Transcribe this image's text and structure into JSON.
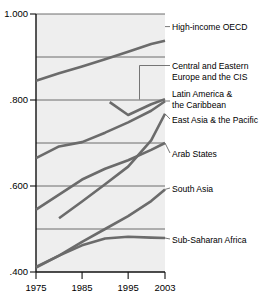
{
  "chart_data": {
    "type": "line",
    "title": "",
    "subtitle": "",
    "xlabel": "",
    "ylabel": "",
    "x": [
      1975,
      1980,
      1985,
      1990,
      1995,
      2000,
      2003
    ],
    "xlim": [
      1975,
      2003
    ],
    "ylim": [
      0.4,
      1.0
    ],
    "grid": true,
    "gridlines_y": [
      0.5,
      0.6,
      0.7,
      0.8,
      0.9,
      1.0
    ],
    "legend_position": "right-inline-labels",
    "x_ticks": [
      "1975",
      "1985",
      "1995",
      "2003"
    ],
    "x_tick_values": [
      1975,
      1985,
      1995,
      2003
    ],
    "y_ticks": [
      "1.000",
      ".800",
      ".600",
      ".400"
    ],
    "y_tick_values": [
      1.0,
      0.8,
      0.6,
      0.4
    ],
    "series": [
      {
        "name": "High-income OECD",
        "label": "High-income OECD",
        "color": "#6b6b6b",
        "x": [
          1975,
          1980,
          1985,
          1990,
          1995,
          2000,
          2003
        ],
        "values": [
          0.845,
          0.862,
          0.878,
          0.895,
          0.912,
          0.93,
          0.938
        ]
      },
      {
        "name": "Central and Eastern Europe and the CIS",
        "label": "Central and Eastern Europe and the CIS",
        "color": "#6b6b6b",
        "x": [
          1991,
          1995,
          2000,
          2003
        ],
        "values": [
          0.795,
          0.765,
          0.79,
          0.802
        ]
      },
      {
        "name": "Latin America & the Caribbean",
        "label": "Latin America & the Caribbean",
        "color": "#6b6b6b",
        "x": [
          1975,
          1980,
          1985,
          1990,
          1995,
          2000,
          2003
        ],
        "values": [
          0.665,
          0.692,
          0.702,
          0.724,
          0.748,
          0.775,
          0.797
        ]
      },
      {
        "name": "East Asia & the Pacific",
        "label": "East Asia & the Pacific",
        "color": "#6b6b6b",
        "x": [
          1980,
          1985,
          1990,
          1995,
          2000,
          2003
        ],
        "values": [
          0.525,
          0.564,
          0.604,
          0.645,
          0.706,
          0.768
        ]
      },
      {
        "name": "Arab States",
        "label": "Arab States",
        "color": "#6b6b6b",
        "x": [
          1975,
          1980,
          1985,
          1990,
          1995,
          2000,
          2003
        ],
        "values": [
          0.545,
          0.58,
          0.615,
          0.64,
          0.66,
          0.684,
          0.7
        ]
      },
      {
        "name": "South Asia",
        "label": "South Asia",
        "color": "#6b6b6b",
        "x": [
          1975,
          1980,
          1985,
          1990,
          1995,
          2000,
          2003
        ],
        "values": [
          0.412,
          0.438,
          0.47,
          0.5,
          0.53,
          0.565,
          0.592
        ]
      },
      {
        "name": "Sub-Saharan Africa",
        "label": "Sub-Saharan Africa",
        "color": "#6b6b6b",
        "x": [
          1975,
          1980,
          1985,
          1990,
          1995,
          2000,
          2003
        ],
        "values": [
          0.41,
          0.438,
          0.462,
          0.478,
          0.482,
          0.48,
          0.479
        ]
      }
    ],
    "annotations": [
      {
        "name": "label-high-income-oecd",
        "text": "High-income OECD",
        "x": 172,
        "y": 30
      },
      {
        "name": "label-central-eastern-europe-line1",
        "text": "Central and Eastern",
        "x": 172,
        "y": 69
      },
      {
        "name": "label-central-eastern-europe-line2",
        "text": "Europe and the CIS",
        "x": 172,
        "y": 80
      },
      {
        "name": "label-latin-america-line1",
        "text": "Latin America &",
        "x": 172,
        "y": 97
      },
      {
        "name": "label-latin-america-line2",
        "text": "the Caribbean",
        "x": 172,
        "y": 108
      },
      {
        "name": "label-east-asia-pacific",
        "text": "East Asia & the Pacific",
        "x": 172,
        "y": 123
      },
      {
        "name": "label-arab-states",
        "text": "Arab States",
        "x": 172,
        "y": 157
      },
      {
        "name": "label-south-asia",
        "text": "South Asia",
        "x": 172,
        "y": 192
      },
      {
        "name": "label-sub-saharan-africa",
        "text": "Sub-Saharan Africa",
        "x": 172,
        "y": 243
      }
    ],
    "colors": {
      "plot_background": "#eeeeee",
      "line": "#6b6b6b",
      "grid": "#4a4a4a",
      "axis": "#111111",
      "text": "#000000",
      "page_background": "#ffffff"
    }
  }
}
